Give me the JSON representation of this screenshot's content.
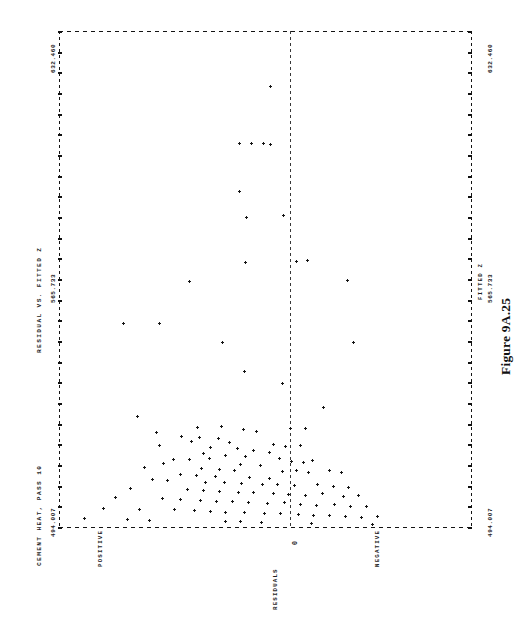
{
  "figure": {
    "caption": "Figure 9A.25",
    "title": "CEMENT HEAT, PASS 10",
    "subtitle": "RESIDUAL VS. FITTED Z"
  },
  "chart_data": {
    "type": "scatter",
    "title": "CEMENT HEAT, PASS 10",
    "subtitle": "RESIDUAL VS. FITTED Z",
    "orientation": "rotated-90-ccw",
    "xlabel": "RESIDUALS",
    "ylabel": "FITTED Z",
    "xticklabels": [
      "POSITIVE",
      "0",
      "NEGATIVE"
    ],
    "yticklabels": [
      "494.007",
      "565.733",
      "632.460"
    ],
    "ylim": [
      494.007,
      632.46
    ],
    "ytick_values": [
      494.007,
      565.733,
      632.46
    ],
    "grid": false,
    "legend": null,
    "zero_reference_line": true,
    "axis_style": "dashed-line-printer",
    "marker": "plus",
    "n_points": 124,
    "points": [
      [
        0.512,
        0.112
      ],
      [
        0.438,
        0.226
      ],
      [
        0.466,
        0.226
      ],
      [
        0.496,
        0.226
      ],
      [
        0.513,
        0.228
      ],
      [
        0.437,
        0.322
      ],
      [
        0.455,
        0.375
      ],
      [
        0.543,
        0.372
      ],
      [
        0.452,
        0.465
      ],
      [
        0.574,
        0.463
      ],
      [
        0.601,
        0.462
      ],
      [
        0.317,
        0.504
      ],
      [
        0.699,
        0.503
      ],
      [
        0.155,
        0.588
      ],
      [
        0.244,
        0.588
      ],
      [
        0.396,
        0.627
      ],
      [
        0.713,
        0.627
      ],
      [
        0.449,
        0.686
      ],
      [
        0.54,
        0.709
      ],
      [
        0.64,
        0.757
      ],
      [
        0.394,
        0.795
      ],
      [
        0.447,
        0.801
      ],
      [
        0.56,
        0.799
      ],
      [
        0.597,
        0.8
      ],
      [
        0.191,
        0.776
      ],
      [
        0.335,
        0.797
      ],
      [
        0.236,
        0.808
      ],
      [
        0.478,
        0.806
      ],
      [
        0.296,
        0.815
      ],
      [
        0.339,
        0.818
      ],
      [
        0.385,
        0.82
      ],
      [
        0.322,
        0.826
      ],
      [
        0.413,
        0.828
      ],
      [
        0.243,
        0.835
      ],
      [
        0.368,
        0.838
      ],
      [
        0.432,
        0.84
      ],
      [
        0.519,
        0.832
      ],
      [
        0.548,
        0.836
      ],
      [
        0.585,
        0.833
      ],
      [
        0.47,
        0.845
      ],
      [
        0.349,
        0.85
      ],
      [
        0.509,
        0.849
      ],
      [
        0.404,
        0.854
      ],
      [
        0.452,
        0.856
      ],
      [
        0.278,
        0.862
      ],
      [
        0.317,
        0.862
      ],
      [
        0.365,
        0.86
      ],
      [
        0.533,
        0.861
      ],
      [
        0.563,
        0.866
      ],
      [
        0.592,
        0.868
      ],
      [
        0.614,
        0.864
      ],
      [
        0.252,
        0.87
      ],
      [
        0.44,
        0.872
      ],
      [
        0.487,
        0.874
      ],
      [
        0.207,
        0.878
      ],
      [
        0.345,
        0.88
      ],
      [
        0.389,
        0.882
      ],
      [
        0.425,
        0.884
      ],
      [
        0.541,
        0.886
      ],
      [
        0.576,
        0.884
      ],
      [
        0.604,
        0.888
      ],
      [
        0.655,
        0.885
      ],
      [
        0.683,
        0.888
      ],
      [
        0.295,
        0.892
      ],
      [
        0.333,
        0.895
      ],
      [
        0.38,
        0.897
      ],
      [
        0.462,
        0.898
      ],
      [
        0.51,
        0.9
      ],
      [
        0.226,
        0.903
      ],
      [
        0.263,
        0.905
      ],
      [
        0.355,
        0.908
      ],
      [
        0.401,
        0.908
      ],
      [
        0.441,
        0.91
      ],
      [
        0.492,
        0.912
      ],
      [
        0.53,
        0.913
      ],
      [
        0.571,
        0.915
      ],
      [
        0.626,
        0.912
      ],
      [
        0.664,
        0.916
      ],
      [
        0.702,
        0.918
      ],
      [
        0.172,
        0.92
      ],
      [
        0.31,
        0.922
      ],
      [
        0.35,
        0.924
      ],
      [
        0.388,
        0.926
      ],
      [
        0.434,
        0.928
      ],
      [
        0.472,
        0.928
      ],
      [
        0.519,
        0.93
      ],
      [
        0.556,
        0.932
      ],
      [
        0.597,
        0.934
      ],
      [
        0.639,
        0.93
      ],
      [
        0.688,
        0.936
      ],
      [
        0.726,
        0.935
      ],
      [
        0.137,
        0.938
      ],
      [
        0.25,
        0.94
      ],
      [
        0.294,
        0.942
      ],
      [
        0.343,
        0.944
      ],
      [
        0.381,
        0.946
      ],
      [
        0.421,
        0.946
      ],
      [
        0.46,
        0.948
      ],
      [
        0.505,
        0.95
      ],
      [
        0.545,
        0.948
      ],
      [
        0.585,
        0.952
      ],
      [
        0.623,
        0.954
      ],
      [
        0.667,
        0.952
      ],
      [
        0.707,
        0.956
      ],
      [
        0.745,
        0.956
      ],
      [
        0.108,
        0.96
      ],
      [
        0.196,
        0.962
      ],
      [
        0.28,
        0.962
      ],
      [
        0.328,
        0.964
      ],
      [
        0.366,
        0.966
      ],
      [
        0.404,
        0.968
      ],
      [
        0.45,
        0.968
      ],
      [
        0.497,
        0.97
      ],
      [
        0.537,
        0.97
      ],
      [
        0.579,
        0.972
      ],
      [
        0.616,
        0.974
      ],
      [
        0.655,
        0.974
      ],
      [
        0.694,
        0.976
      ],
      [
        0.733,
        0.978
      ],
      [
        0.77,
        0.976
      ],
      [
        0.062,
        0.98
      ],
      [
        0.165,
        0.982
      ],
      [
        0.218,
        0.984
      ],
      [
        0.404,
        0.986
      ],
      [
        0.44,
        0.986
      ],
      [
        0.49,
        0.988
      ],
      [
        0.612,
        0.99
      ],
      [
        0.76,
        0.992
      ]
    ]
  },
  "axes": {
    "left_axis_label_top": "632.460",
    "left_axis_label_mid": "565.733",
    "left_axis_label_bottom": "494.007",
    "right_axis_label_top": "632.460",
    "right_axis_label_mid": "565.733",
    "right_axis_label_bottom": "494.007",
    "right_axis_name": "FITTED Z",
    "category_positive": "POSITIVE",
    "category_zero": "0",
    "category_negative": "NEGATIVE",
    "residual_axis_name": "RESIDUALS"
  }
}
